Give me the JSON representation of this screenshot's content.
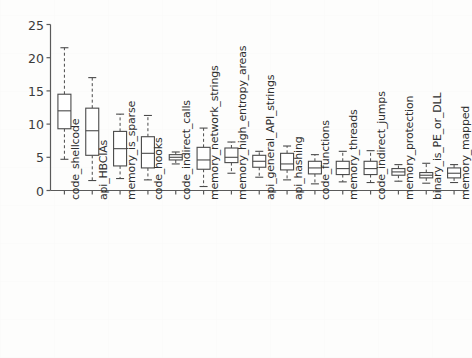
{
  "chart_data": {
    "type": "box",
    "title": "",
    "xlabel": "",
    "ylabel": "Importance (%)",
    "ylim": [
      0,
      25
    ],
    "yticks": [
      0,
      5,
      10,
      15,
      20,
      25
    ],
    "grid": false,
    "legend": null,
    "orientation": "vertical",
    "box_fill": "#ffffff",
    "box_edge_color": "#4a4a4a",
    "whisker_style": "dashed",
    "median_color": "#4a4a4a",
    "categories": [
      "code_shellcode",
      "api_HBCIAs",
      "memory_is_sparse",
      "code_hooks",
      "code_indirect_calls",
      "memory_network_strings",
      "memory_high_entropy_areas",
      "api_general_API_strings",
      "api_hashing",
      "code_functions",
      "memory_threads",
      "code_indirect_jumps",
      "memory_protection",
      "binary_is_PE_or_DLL",
      "memory_mapped"
    ],
    "boxes": [
      {
        "label": "code_shellcode",
        "whisker_low": 4.7,
        "q1": 9.3,
        "median": 12.0,
        "q3": 14.5,
        "whisker_high": 21.5
      },
      {
        "label": "api_HBCIAs",
        "whisker_low": 1.5,
        "q1": 5.3,
        "median": 9.0,
        "q3": 12.4,
        "whisker_high": 17.0
      },
      {
        "label": "memory_is_sparse",
        "whisker_low": 1.8,
        "q1": 3.7,
        "median": 6.3,
        "q3": 8.9,
        "whisker_high": 11.5
      },
      {
        "label": "code_hooks",
        "whisker_low": 1.6,
        "q1": 3.4,
        "median": 5.6,
        "q3": 8.1,
        "whisker_high": 11.3
      },
      {
        "label": "code_indirect_calls",
        "whisker_low": 4.0,
        "q1": 4.6,
        "median": 5.0,
        "q3": 5.4,
        "whisker_high": 5.8
      },
      {
        "label": "memory_network_strings",
        "whisker_low": 0.6,
        "q1": 3.2,
        "median": 4.6,
        "q3": 6.5,
        "whisker_high": 9.4
      },
      {
        "label": "memory_high_entropy_areas",
        "whisker_low": 2.6,
        "q1": 4.2,
        "median": 5.0,
        "q3": 6.4,
        "whisker_high": 7.3
      },
      {
        "label": "api_general_API_strings",
        "whisker_low": 2.0,
        "q1": 3.5,
        "median": 4.4,
        "q3": 5.3,
        "whisker_high": 5.9
      },
      {
        "label": "api_hashing",
        "whisker_low": 1.6,
        "q1": 3.1,
        "median": 4.0,
        "q3": 5.6,
        "whisker_high": 6.7
      },
      {
        "label": "code_functions",
        "whisker_low": 1.0,
        "q1": 2.5,
        "median": 3.4,
        "q3": 4.4,
        "whisker_high": 5.4
      },
      {
        "label": "memory_threads",
        "whisker_low": 1.3,
        "q1": 2.4,
        "median": 3.3,
        "q3": 4.4,
        "whisker_high": 5.9
      },
      {
        "label": "code_indirect_jumps",
        "whisker_low": 1.2,
        "q1": 2.4,
        "median": 3.3,
        "q3": 4.4,
        "whisker_high": 6.0
      },
      {
        "label": "memory_protection",
        "whisker_low": 1.4,
        "q1": 2.3,
        "median": 2.8,
        "q3": 3.3,
        "whisker_high": 3.9
      },
      {
        "label": "binary_is_PE_or_DLL",
        "whisker_low": 1.1,
        "q1": 1.9,
        "median": 2.3,
        "q3": 2.7,
        "whisker_high": 4.1
      },
      {
        "label": "memory_mapped",
        "whisker_low": 1.2,
        "q1": 1.9,
        "median": 2.6,
        "q3": 3.4,
        "whisker_high": 3.9
      }
    ]
  }
}
